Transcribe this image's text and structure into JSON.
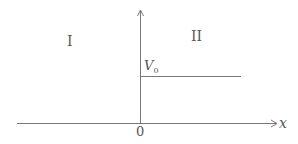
{
  "diagram": {
    "region_left_label": "I",
    "region_right_label": "II",
    "potential_label": "V",
    "potential_subscript": "0",
    "origin_label": "0",
    "x_axis_label": "x",
    "colors": {
      "line": "#777777",
      "text": "#555555",
      "background": "#ffffff"
    }
  }
}
